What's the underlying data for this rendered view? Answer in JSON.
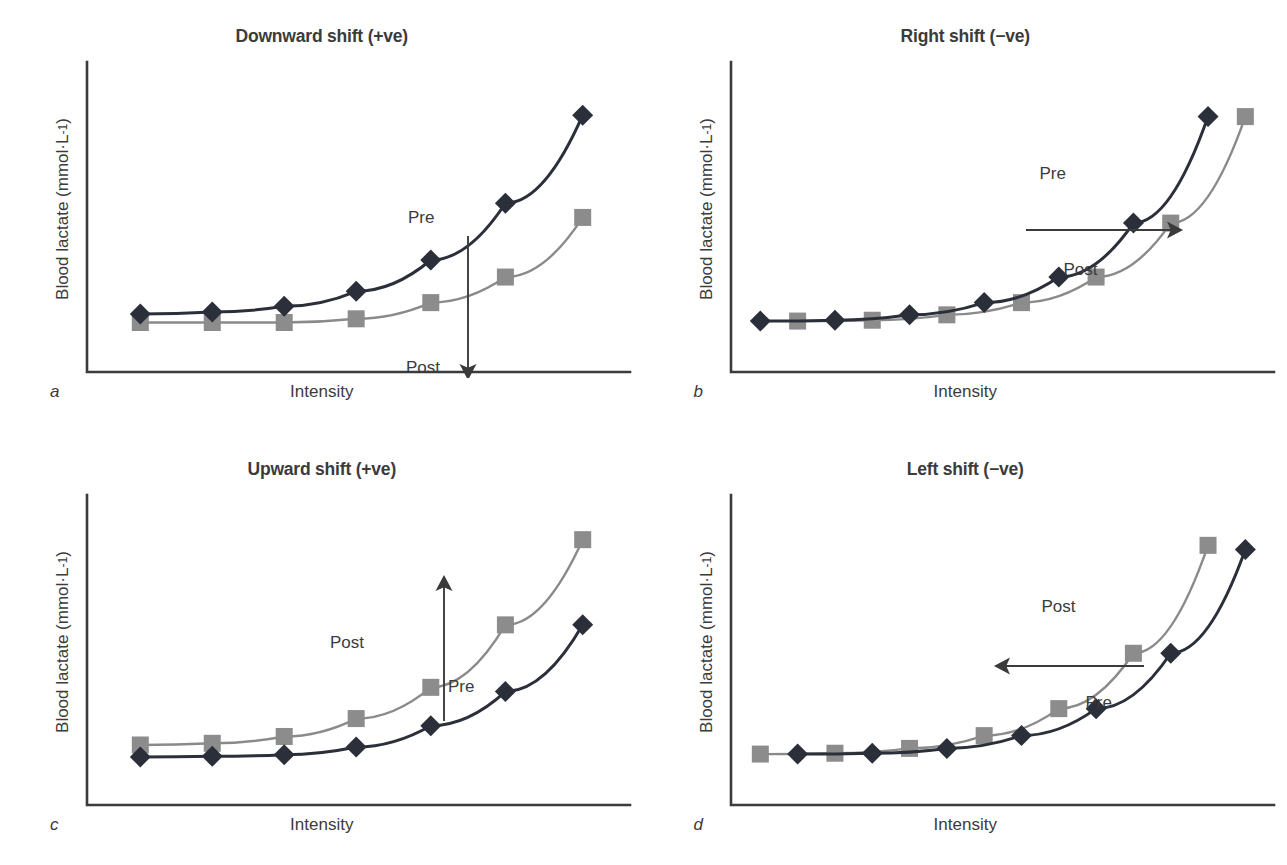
{
  "figure": {
    "axis_labels": {
      "y": "Blood lactate (mmol·L",
      "y_exponent": "-1",
      "y_close": ")",
      "y_full": "Blood lactate (mmol·L⁻¹)",
      "x": "Intensity"
    },
    "colors": {
      "pre_line": "#2b2f3a",
      "pre_marker": "#2b2f3a",
      "post_line": "#8a8a8a",
      "post_marker": "#8c8c8c",
      "axis": "#3b3b3b",
      "text": "#3b3b3b",
      "background": "#ffffff"
    },
    "series_names": {
      "pre": "Pre",
      "post": "Post"
    }
  },
  "panels": [
    {
      "id": "a",
      "letter": "a",
      "title": "Downward shift (+ve)",
      "pre_label": "Pre",
      "post_label": "Post",
      "arrow": "down",
      "pre_label_pos": {
        "x": 408,
        "y": 160
      },
      "post_label_pos": {
        "x": 406,
        "y": 310
      },
      "arrow_path": {
        "x1": 468,
        "y1": 188,
        "x2": 468,
        "y2": 330
      },
      "chart_data": {
        "type": "line",
        "title": "Downward shift (+ve)",
        "xlabel": "Intensity",
        "ylabel": "Blood lactate (mmol·L⁻¹)",
        "grid": false,
        "legend": "inline-annotations",
        "xlim": [
          0,
          10
        ],
        "ylim": [
          0,
          10
        ],
        "x": [
          1.0,
          2.4,
          3.8,
          5.2,
          6.6,
          8.0,
          9.4
        ],
        "series": [
          {
            "name": "Pre",
            "marker": "diamond",
            "color": "#2b2f3a",
            "x": [
              1.0,
              2.35,
              3.7,
              5.05,
              6.45,
              7.85,
              9.3
            ],
            "values": [
              1.55,
              1.62,
              1.82,
              2.35,
              3.45,
              5.45,
              8.55
            ]
          },
          {
            "name": "Post",
            "marker": "square",
            "color": "#8c8c8c",
            "x": [
              1.0,
              2.35,
              3.7,
              5.05,
              6.45,
              7.85,
              9.3
            ],
            "values": [
              1.25,
              1.25,
              1.25,
              1.38,
              1.95,
              2.85,
              4.95
            ]
          }
        ]
      }
    },
    {
      "id": "b",
      "letter": "b",
      "title": "Right shift (−ve)",
      "pre_label": "Pre",
      "post_label": "Post",
      "arrow": "right",
      "pre_label_pos": {
        "x": 396,
        "y": 116
      },
      "post_label_pos": {
        "x": 420,
        "y": 212
      },
      "arrow_path": {
        "x1": 382,
        "y1": 182,
        "x2": 537,
        "y2": 182
      },
      "chart_data": {
        "type": "line",
        "title": "Right shift (−ve)",
        "xlabel": "Intensity",
        "ylabel": "Blood lactate (mmol·L⁻¹)",
        "grid": false,
        "legend": "inline-annotations",
        "xlim": [
          0,
          10
        ],
        "ylim": [
          0,
          10
        ],
        "series": [
          {
            "name": "Pre",
            "marker": "diamond",
            "color": "#2b2f3a",
            "x": [
              0.55,
              1.95,
              3.35,
              4.75,
              6.15,
              7.55,
              8.95
            ],
            "values": [
              1.3,
              1.33,
              1.52,
              1.95,
              2.85,
              4.75,
              8.5
            ]
          },
          {
            "name": "Post",
            "marker": "square",
            "color": "#8c8c8c",
            "x": [
              1.25,
              2.65,
              4.05,
              5.45,
              6.85,
              8.25,
              9.65
            ],
            "values": [
              1.3,
              1.33,
              1.52,
              1.95,
              2.85,
              4.75,
              8.5
            ]
          }
        ]
      }
    },
    {
      "id": "c",
      "letter": "c",
      "title": "Upward shift (+ve)",
      "pre_label": "Pre",
      "post_label": "Post",
      "arrow": "up",
      "pre_label_pos": {
        "x": 448,
        "y": 196
      },
      "post_label_pos": {
        "x": 330,
        "y": 152
      },
      "arrow_path": {
        "x1": 444,
        "y1": 240,
        "x2": 444,
        "y2": 96
      },
      "chart_data": {
        "type": "line",
        "title": "Upward shift (+ve)",
        "xlabel": "Intensity",
        "ylabel": "Blood lactate (mmol·L⁻¹)",
        "grid": false,
        "legend": "inline-annotations",
        "xlim": [
          0,
          10
        ],
        "ylim": [
          0,
          10
        ],
        "series": [
          {
            "name": "Pre",
            "marker": "diamond",
            "color": "#2b2f3a",
            "x": [
              1.0,
              2.35,
              3.7,
              5.05,
              6.45,
              7.85,
              9.3
            ],
            "values": [
              1.2,
              1.22,
              1.28,
              1.55,
              2.3,
              3.5,
              5.85
            ]
          },
          {
            "name": "Post",
            "marker": "square",
            "color": "#8c8c8c",
            "x": [
              1.0,
              2.35,
              3.7,
              5.05,
              6.45,
              7.85,
              9.3
            ],
            "values": [
              1.62,
              1.68,
              1.92,
              2.55,
              3.65,
              5.85,
              8.85
            ]
          }
        ]
      }
    },
    {
      "id": "d",
      "letter": "d",
      "title": "Left shift (−ve)",
      "pre_label": "Pre",
      "post_label": "Post",
      "arrow": "left",
      "pre_label_pos": {
        "x": 442,
        "y": 212
      },
      "post_label_pos": {
        "x": 398,
        "y": 116
      },
      "arrow_path": {
        "x1": 500,
        "y1": 185,
        "x2": 352,
        "y2": 185
      },
      "chart_data": {
        "type": "line",
        "title": "Left shift (−ve)",
        "xlabel": "Intensity",
        "ylabel": "Blood lactate (mmol·L⁻¹)",
        "grid": false,
        "legend": "inline-annotations",
        "xlim": [
          0,
          10
        ],
        "ylim": [
          0,
          10
        ],
        "series": [
          {
            "name": "Pre",
            "marker": "diamond",
            "color": "#2b2f3a",
            "x": [
              1.25,
              2.65,
              4.05,
              5.45,
              6.85,
              8.25,
              9.65
            ],
            "values": [
              1.3,
              1.33,
              1.5,
              1.95,
              2.9,
              4.85,
              8.5
            ]
          },
          {
            "name": "Post",
            "marker": "square",
            "color": "#8c8c8c",
            "x": [
              0.55,
              1.95,
              3.35,
              4.75,
              6.15,
              7.55,
              8.95
            ],
            "values": [
              1.3,
              1.33,
              1.5,
              1.95,
              2.9,
              4.85,
              8.65
            ]
          }
        ]
      }
    }
  ]
}
